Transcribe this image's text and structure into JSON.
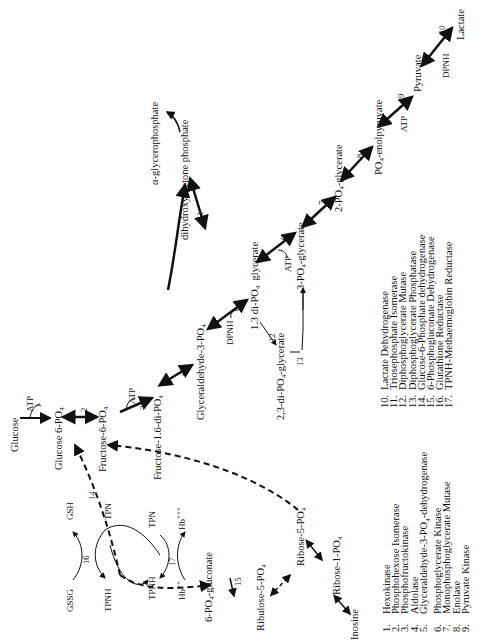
{
  "diagram": {
    "orientation": "rotated-90-ccw",
    "metabolites": {
      "glucose": "Glucose",
      "glucose_6_po4": "Glucose 6-PO4",
      "fructose_6_po4": "Fructose-6-PO4",
      "fructose_1_6_di_po4": "Fructose-1.6-di-PO4",
      "glyceraldehyde_3_po4": "Glyceraldehyde-3-PO4",
      "dihydroxyacetone_phosphate": "dihydroxyacetone phosphate",
      "alpha_glycerophosphate": "α-glycerophosphate",
      "di_po4_1_3_glycerate": "1.3 di-PO4  glycerate",
      "di_po4_2_3_glycerate": "2,3-di-PO4-glycerate",
      "po4_3_glycerate": "3-PO4-glycerate",
      "po4_2_glycerate": "2-PO4-glycerate",
      "po4_enolpyruvate": "PO4-enolpyruvate",
      "pyruvate": "Pyruvate",
      "lactate": "Lactate",
      "gluconate_6_po4": "6-PO4-gluconate",
      "ribulose_5_po4": "Ribulose-5-PO4",
      "ribose_5_po4": "Ribose-5-PO4",
      "ribose_1_po4": "Ribose-1-PO4",
      "inosine": "Inosine"
    },
    "cofactors": {
      "atp_1": "ATP",
      "atp_3": "ATP",
      "atp_6": "ATP",
      "atp_9": "ATP",
      "dpnh_5": "DPNH",
      "dpnh_10": "DPNH",
      "gssg": "GSSG",
      "gsh": "GSH",
      "tpn_a": "TPN",
      "tpnh_a": "TPNH",
      "tpn_b": "TPN",
      "tpnh_b": "TPNH",
      "hb_2": "Hb++",
      "hb_3": "Hb+++"
    },
    "step_numbers": [
      "1",
      "2",
      "3",
      "4",
      "5",
      "6",
      "7",
      "8",
      "9",
      "10",
      "11",
      "12",
      "13",
      "14",
      "15",
      "16",
      "17"
    ]
  },
  "legend": {
    "left": [
      {
        "num": "1.",
        "name": "Hexokinase"
      },
      {
        "num": "2.",
        "name": "Phosphohexose Isomerase"
      },
      {
        "num": "3.",
        "name": "Phosphofructokinase"
      },
      {
        "num": "4.",
        "name": "Aldolase"
      },
      {
        "num": "5.",
        "name": "Glyceraldehyde-3-PO4-dehydrogenase"
      },
      {
        "num": "6.",
        "name": "Phosphoglycerate Kinase"
      },
      {
        "num": "7.",
        "name": "Monophosphoglycerate Mutase"
      },
      {
        "num": "8.",
        "name": "Enolase"
      },
      {
        "num": "9.",
        "name": "Pyruvate Kinase"
      }
    ],
    "right": [
      {
        "num": "10.",
        "name": "Lactate Dehydrogenase"
      },
      {
        "num": "11.",
        "name": "Triosephosphate Isomerase"
      },
      {
        "num": "12.",
        "name": "Diphosphoglycerate Mutase"
      },
      {
        "num": "13.",
        "name": "Diphosphoglycerate Phosphatase"
      },
      {
        "num": "14.",
        "name": "Glucose-6-Phosphate dehydrogenase"
      },
      {
        "num": "15.",
        "name": "6-Phosphogluconate Dehydrogenase"
      },
      {
        "num": "16.",
        "name": "Glutathione Reductase"
      },
      {
        "num": "17.",
        "name": "TPNH-Methaemoglobin Reductase"
      }
    ]
  },
  "colors": {
    "ink": "#111111",
    "background": "#ffffff"
  }
}
